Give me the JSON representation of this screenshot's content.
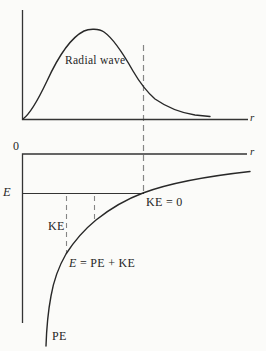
{
  "figure": {
    "top_plot": {
      "curve_label": "Radial wave",
      "x_axis_label": "r"
    },
    "bottom_plot": {
      "origin_label": "0",
      "x_axis_label": "r",
      "energy_level_label": "E",
      "ke_zero_label": "KE = 0",
      "ke_label": "KE",
      "equation_lhs": "E",
      "equation_rhs": " = PE + KE",
      "pe_label": "PE"
    },
    "colors": {
      "line": "#343434",
      "curve": "#282828",
      "dashed": "#858585",
      "background": "#fbfbf9"
    }
  }
}
